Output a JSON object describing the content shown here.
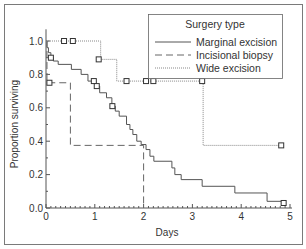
{
  "chart_data": {
    "type": "line",
    "subtype": "kaplan-meier step",
    "title": "",
    "xlabel": "Days",
    "ylabel": "Proportion surviving",
    "xlim": [
      0,
      5
    ],
    "ylim": [
      0,
      1.0
    ],
    "xticks": [
      "0",
      "1",
      "2",
      "3",
      "4",
      "5"
    ],
    "yticks": [
      "0.0",
      "0.2",
      "0.4",
      "0.6",
      "0.8",
      "1.0"
    ],
    "grid": false,
    "legend": {
      "title": "Surgery type",
      "position": "upper right",
      "entries": [
        "Marginal excision",
        "Incisional biopsy",
        "Wide excision"
      ]
    },
    "series": [
      {
        "name": "Marginal excision",
        "style": "solid",
        "steps": [
          [
            0,
            1.0
          ],
          [
            0.02,
            0.96
          ],
          [
            0.05,
            0.93
          ],
          [
            0.1,
            0.9
          ],
          [
            0.15,
            0.88
          ],
          [
            0.25,
            0.86
          ],
          [
            0.52,
            0.83
          ],
          [
            0.72,
            0.8
          ],
          [
            0.86,
            0.76
          ],
          [
            1.02,
            0.73
          ],
          [
            1.1,
            0.69
          ],
          [
            1.24,
            0.66
          ],
          [
            1.35,
            0.61
          ],
          [
            1.42,
            0.58
          ],
          [
            1.5,
            0.55
          ],
          [
            1.65,
            0.5
          ],
          [
            1.72,
            0.47
          ],
          [
            1.78,
            0.44
          ],
          [
            1.86,
            0.4
          ],
          [
            1.95,
            0.38
          ],
          [
            2.05,
            0.35
          ],
          [
            2.13,
            0.31
          ],
          [
            2.21,
            0.28
          ],
          [
            2.58,
            0.24
          ],
          [
            2.64,
            0.2
          ],
          [
            2.77,
            0.17
          ],
          [
            3.2,
            0.13
          ],
          [
            3.87,
            0.09
          ],
          [
            4.53,
            0.04
          ],
          [
            4.9,
            0.04
          ]
        ],
        "censored": [
          [
            0.1,
            0.9
          ],
          [
            0.98,
            0.76
          ],
          [
            1.04,
            0.73
          ],
          [
            1.36,
            0.61
          ],
          [
            4.87,
            0.03
          ]
        ]
      },
      {
        "name": "Incisional biopsy",
        "style": "dashed",
        "steps": [
          [
            0,
            1.0
          ],
          [
            0.02,
            0.75
          ],
          [
            0.5,
            0.375
          ],
          [
            2.0,
            0.0
          ]
        ],
        "censored": [
          [
            0.07,
            0.75
          ]
        ]
      },
      {
        "name": "Wide excision",
        "style": "dotted",
        "steps": [
          [
            0,
            1.0
          ],
          [
            1.12,
            0.89
          ],
          [
            1.45,
            0.76
          ],
          [
            3.22,
            0.375
          ],
          [
            4.85,
            0.375
          ]
        ],
        "censored": [
          [
            0.37,
            1.0
          ],
          [
            0.55,
            1.0
          ],
          [
            1.08,
            0.89
          ],
          [
            1.65,
            0.76
          ],
          [
            2.05,
            0.76
          ],
          [
            2.2,
            0.76
          ],
          [
            3.2,
            0.76
          ],
          [
            4.82,
            0.375
          ]
        ]
      }
    ]
  }
}
